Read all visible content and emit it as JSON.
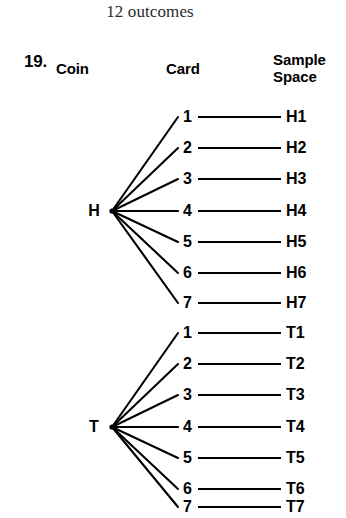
{
  "caption": "12 outcomes",
  "problem": {
    "number": "19."
  },
  "columns": {
    "coin": "Coin",
    "card": "Card",
    "sample_space_line1": "Sample",
    "sample_space_line2": "Space"
  },
  "colors": {
    "ink": "#000000",
    "background": "#ffffff",
    "caption_ink": "#2b2b2b"
  },
  "chart_data": {
    "type": "diagram",
    "diagram_kind": "tree-diagram",
    "title": "12 outcomes",
    "columns": [
      "Coin",
      "Card",
      "Sample Space"
    ],
    "branches": [
      {
        "coin": "H",
        "cards": [
          "1",
          "2",
          "3",
          "4",
          "5",
          "6",
          "7"
        ],
        "outcomes": [
          "H1",
          "H2",
          "H3",
          "H4",
          "H5",
          "H6",
          "H7"
        ]
      },
      {
        "coin": "T",
        "cards": [
          "1",
          "2",
          "3",
          "4",
          "5",
          "6",
          "7"
        ],
        "outcomes": [
          "T1",
          "T2",
          "T3",
          "T4",
          "T5",
          "T6",
          "T7"
        ]
      }
    ],
    "total_outcomes": 14
  },
  "tree": {
    "groups": [
      {
        "id": "coin-h",
        "coin": "H",
        "node_x": 112,
        "node_y": 211,
        "label_x": 84,
        "label_y": 203,
        "rows": [
          {
            "card": "1",
            "outcome": "H1",
            "y": 117
          },
          {
            "card": "2",
            "outcome": "H2",
            "y": 148
          },
          {
            "card": "3",
            "outcome": "H3",
            "y": 179
          },
          {
            "card": "4",
            "outcome": "H4",
            "y": 211
          },
          {
            "card": "5",
            "outcome": "H5",
            "y": 242
          },
          {
            "card": "6",
            "outcome": "H6",
            "y": 273
          },
          {
            "card": "7",
            "outcome": "H7",
            "y": 303
          }
        ]
      },
      {
        "id": "coin-t",
        "coin": "T",
        "node_x": 112,
        "node_y": 427,
        "label_x": 84,
        "label_y": 419,
        "rows": [
          {
            "card": "1",
            "outcome": "T1",
            "y": 333
          },
          {
            "card": "2",
            "outcome": "T2",
            "y": 364
          },
          {
            "card": "3",
            "outcome": "T3",
            "y": 395
          },
          {
            "card": "4",
            "outcome": "T4",
            "y": 427
          },
          {
            "card": "5",
            "outcome": "T5",
            "y": 458
          },
          {
            "card": "6",
            "outcome": "T6",
            "y": 489
          },
          {
            "card": "7",
            "outcome": "T7",
            "y": 507
          }
        ]
      }
    ],
    "geometry": {
      "branch_end_x": 178,
      "card_text_x": 183,
      "connector_start_x": 198,
      "connector_end_x": 281,
      "outcome_text_x": 286
    }
  }
}
